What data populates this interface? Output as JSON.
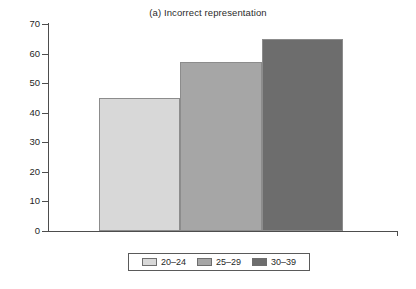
{
  "chart_data": {
    "type": "bar",
    "title": "(a) Incorrect representation",
    "subtitle": "",
    "xlabel": "",
    "ylabel": "",
    "categories": [
      "20–24",
      "25–29",
      "30–39"
    ],
    "values": [
      45,
      57,
      65
    ],
    "series": [
      {
        "name": "age-groups",
        "values": [
          45,
          57,
          65
        ]
      }
    ],
    "ylim": [
      0,
      70
    ],
    "yticks": [
      0,
      10,
      20,
      30,
      40,
      50,
      60,
      70
    ],
    "ytick_labels": [
      "0",
      "10",
      "20",
      "30",
      "40",
      "50",
      "60",
      "70"
    ],
    "grid": false,
    "legend_position": "bottom-center",
    "legend_entries": [
      {
        "label": "20–24",
        "color": "#d8d8d8"
      },
      {
        "label": "25–29",
        "color": "#a6a6a6"
      },
      {
        "label": "30–39",
        "color": "#6d6d6d"
      }
    ],
    "bar_colors": [
      "#d8d8d8",
      "#a6a6a6",
      "#6d6d6d"
    ],
    "bar_border_color": "#8c8c8c",
    "axis_color": "#4d4d4d",
    "background_color": "#ffffff",
    "text_color": "#1f1f1f"
  }
}
